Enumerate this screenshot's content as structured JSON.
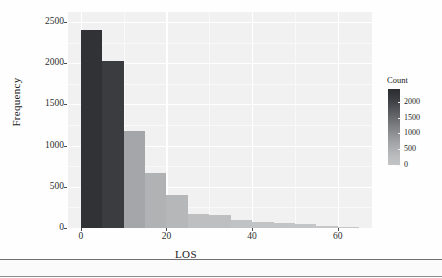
{
  "chart_data": {
    "type": "bar",
    "title": "",
    "subtitle": "",
    "xlabel": "LOS",
    "ylabel": "Frequency",
    "xlim": [
      -3,
      68
    ],
    "ylim": [
      0,
      2620
    ],
    "grid": true,
    "bin_width": 5,
    "x_ticks": [
      0,
      20,
      40,
      60
    ],
    "x_tick_labels": [
      "0",
      "20",
      "40",
      "60"
    ],
    "y_ticks": [
      0,
      500,
      1000,
      1500,
      2000,
      2500
    ],
    "y_tick_labels": [
      "0",
      "500",
      "1000",
      "1500",
      "2000",
      "2500"
    ],
    "categories": [
      "0-5",
      "5-10",
      "10-15",
      "15-20",
      "20-25",
      "25-30",
      "30-35",
      "35-40",
      "40-45",
      "45-50",
      "50-55",
      "55-60",
      "60-65"
    ],
    "bin_starts": [
      0,
      5,
      10,
      15,
      20,
      25,
      30,
      35,
      40,
      45,
      50,
      55,
      60
    ],
    "values": [
      2400,
      2030,
      1180,
      670,
      395,
      165,
      155,
      95,
      75,
      60,
      45,
      30,
      8
    ],
    "bar_colors": [
      "#303236",
      "#3a3c40",
      "#a4a6a9",
      "#b0b2b4",
      "#b5b7b9",
      "#bdbfc1",
      "#bdbfc1",
      "#c0c2c4",
      "#c1c3c5",
      "#c2c4c6",
      "#c3c5c7",
      "#c4c6c8",
      "#c5c7c9"
    ],
    "legend": {
      "title": "Count",
      "position": "right",
      "type": "colorbar",
      "ticks": [
        2000,
        1500,
        1000,
        500,
        0
      ],
      "tick_labels": [
        "2000",
        "1500",
        "1000",
        "500",
        "0"
      ],
      "gradient_low_color": "#c2c4c6",
      "gradient_high_color": "#2b2c30",
      "range": [
        0,
        2400
      ]
    },
    "panel_background": "#f1f1f1",
    "gridline_color": "#ffffff"
  }
}
